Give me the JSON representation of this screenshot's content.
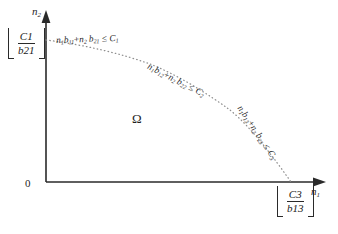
{
  "figure": {
    "background_color": "#ffffff",
    "line_color": "#2a2a2a",
    "curve_color": "#8a8a8a",
    "text_color": "#1f1f1f"
  },
  "axes": {
    "y_axis_label": "n",
    "y_axis_label_sub": "2",
    "x_axis_label": "n",
    "x_axis_label_sub": "1",
    "origin_label": "0"
  },
  "intercepts": {
    "y_intercept": {
      "numerator": "C",
      "numerator_sub": "1",
      "denominator": "b",
      "denominator_sub": "21",
      "notation": "floor"
    },
    "x_intercept": {
      "numerator": "C",
      "numerator_sub": "3",
      "denominator": "b",
      "denominator_sub": "13",
      "notation": "floor"
    }
  },
  "region": {
    "symbol": "Ω"
  },
  "constraints": [
    {
      "id": "constraint-1",
      "n1_coef_var": "b",
      "n1_coef_sub": "11",
      "n2_coef_var": "b",
      "n2_coef_sub": "21",
      "bound_var": "C",
      "bound_sub": "1",
      "relation": "≤",
      "text": "n₁b₁₁+n₂b₂₁ ≤ C₁"
    },
    {
      "id": "constraint-2",
      "n1_coef_var": "b",
      "n1_coef_sub": "12",
      "n2_coef_var": "b",
      "n2_coef_sub": "22",
      "bound_var": "C",
      "bound_sub": "2",
      "relation": "≤",
      "text": "n₁b₁₂+n₂b₂₂ ≤ C₂"
    },
    {
      "id": "constraint-3",
      "n1_coef_var": "b",
      "n1_coef_sub": "13",
      "n2_coef_var": "b",
      "n2_coef_sub": "23",
      "bound_var": "C",
      "bound_sub": "3",
      "relation": "≤",
      "text": "n₁b₁₃+n₂b₂₃ ≤ C₃"
    }
  ],
  "boundary_curve": {
    "style": "dotted",
    "start_point": [
      46,
      40
    ],
    "knee_points": [
      [
        150,
        64
      ],
      [
        230,
        110
      ]
    ],
    "end_point": [
      291,
      182
    ]
  },
  "variables": {
    "n1": "n",
    "n1_sub": "1",
    "n2": "n",
    "n2_sub": "2",
    "plus": "+"
  }
}
